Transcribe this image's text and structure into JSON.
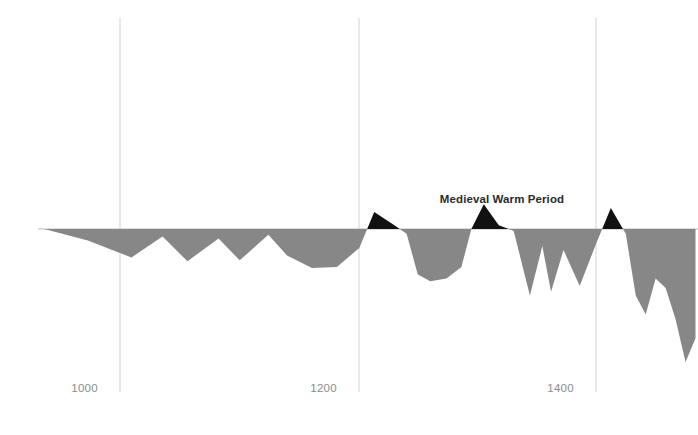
{
  "chart_data": {
    "type": "area",
    "title": "",
    "subtitle": "",
    "xlabel": "",
    "ylabel": "",
    "grid": "vertical-only",
    "legend": "none",
    "baseline_value": 0,
    "xlim": [
      900,
      1430
    ],
    "ylim": [
      -1.6,
      0.45
    ],
    "xticks": [
      1000,
      1200,
      1400
    ],
    "xtick_labels": [
      "1000",
      "1200",
      "1400"
    ],
    "yticks": [],
    "ytick_labels": [],
    "positive_fill_color": "#111111",
    "negative_fill_color": "#878787",
    "gridline_color": "#d6d6d6",
    "axis_color": "#b9b9b9",
    "tick_label_color": "#8c8c8c",
    "annotations": [
      {
        "text": "Medieval Warm Period",
        "x": 1308,
        "y": 0.3,
        "anchor": "middle"
      }
    ],
    "series": [
      {
        "name": "Temperature anomaly",
        "x": [
          905,
          940,
          975,
          1000,
          1020,
          1045,
          1062,
          1085,
          1100,
          1120,
          1140,
          1158,
          1170,
          1185,
          1196,
          1205,
          1215,
          1228,
          1240,
          1248,
          1258,
          1270,
          1282,
          1295,
          1305,
          1312,
          1322,
          1335,
          1348,
          1360,
          1372,
          1380,
          1388,
          1396,
          1404,
          1412,
          1420,
          1428
        ],
        "values": [
          0.0,
          -0.12,
          -0.3,
          -0.08,
          -0.34,
          -0.1,
          -0.33,
          -0.06,
          -0.28,
          -0.41,
          -0.4,
          -0.2,
          0.18,
          0.05,
          -0.05,
          -0.48,
          -0.55,
          -0.52,
          -0.4,
          0.0,
          0.26,
          0.04,
          -0.02,
          -0.7,
          -0.18,
          -0.66,
          -0.22,
          -0.6,
          -0.16,
          0.22,
          -0.05,
          -0.7,
          -0.9,
          -0.52,
          -0.62,
          -0.95,
          -1.4,
          -1.15
        ]
      }
    ]
  },
  "chart_layout": {
    "plot_left": 38,
    "plot_right": 698,
    "baseline_y": 229,
    "plot_top": 18,
    "plot_bottom": 392,
    "gridline_x_positions": [
      120,
      359,
      596
    ],
    "gridline_top": 18,
    "gridline_bottom": 392,
    "tick_label_y": 392,
    "tick_label_offsets": [
      -22,
      -22,
      -22
    ],
    "annotation_x": 502,
    "annotation_y": 203,
    "y_scale_px_per_unit": 95
  }
}
